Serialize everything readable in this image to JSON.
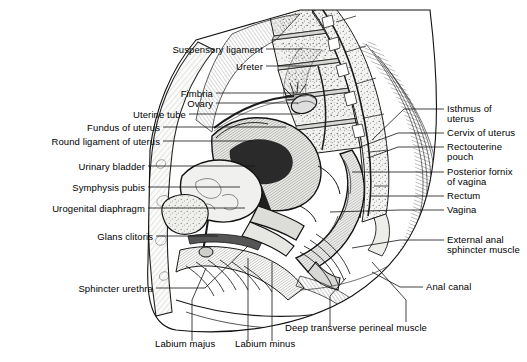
{
  "figure": {
    "background": "#ffffff",
    "ink": "#111111",
    "width": 527,
    "height": 362
  },
  "labels_left": [
    {
      "text": "Suspensory ligament",
      "x": 263,
      "y": 53
    },
    {
      "text": "Ureter",
      "x": 263,
      "y": 70
    },
    {
      "text": "Fimbria",
      "x": 213,
      "y": 97
    },
    {
      "text": "Ovary",
      "x": 213,
      "y": 107
    },
    {
      "text": "Uterine tube",
      "x": 186,
      "y": 118
    },
    {
      "text": "Fundus of uterus",
      "x": 160,
      "y": 131
    },
    {
      "text": "Round ligament of uterus",
      "x": 160,
      "y": 145
    },
    {
      "text": "Urinary bladder",
      "x": 145,
      "y": 170
    },
    {
      "text": "Symphysis pubis",
      "x": 145,
      "y": 191
    },
    {
      "text": "Urogenital diaphragm",
      "x": 145,
      "y": 212
    },
    {
      "text": "Glans clitoris",
      "x": 153,
      "y": 240
    },
    {
      "text": "Sphincter urethra",
      "x": 153,
      "y": 292
    }
  ],
  "labels_right": [
    {
      "text": "Isthmus of",
      "x": 447,
      "y": 112
    },
    {
      "text": "uterus",
      "x": 447,
      "y": 122
    },
    {
      "text": "Cervix of uterus",
      "x": 447,
      "y": 136
    },
    {
      "text": "Rectouterine",
      "x": 447,
      "y": 150
    },
    {
      "text": "pouch",
      "x": 447,
      "y": 160
    },
    {
      "text": "Posterior fornix",
      "x": 447,
      "y": 175
    },
    {
      "text": "of vagina",
      "x": 447,
      "y": 185
    },
    {
      "text": "Rectum",
      "x": 447,
      "y": 199
    },
    {
      "text": "Vagina",
      "x": 447,
      "y": 213
    },
    {
      "text": "External anal",
      "x": 447,
      "y": 243
    },
    {
      "text": "sphincter muscle",
      "x": 447,
      "y": 253
    },
    {
      "text": "Anal canal",
      "x": 426,
      "y": 290
    }
  ],
  "labels_bottom": [
    {
      "text": "Labium majus",
      "x": 155,
      "y": 347
    },
    {
      "text": "Labium minus",
      "x": 235,
      "y": 347
    },
    {
      "text": "Deep transverse perineal muscle",
      "x": 285,
      "y": 331
    }
  ],
  "leaders_left": [
    {
      "name": "suspensory-ligament",
      "d": "M266 49 L302 49"
    },
    {
      "name": "ureter",
      "d": "M266 66 L316 66"
    },
    {
      "name": "fimbria",
      "d": "M216 93 L300 93"
    },
    {
      "name": "ovary",
      "d": "M216 103 L298 103"
    },
    {
      "name": "uterine-tube",
      "d": "M189 114 L300 114"
    },
    {
      "name": "fundus-of-uterus",
      "d": "M163 127 L286 127"
    },
    {
      "name": "round-ligament",
      "d": "M163 141 L252 141"
    },
    {
      "name": "urinary-bladder",
      "d": "M148 166 L255 166"
    },
    {
      "name": "symphysis-pubis",
      "d": "M148 187 L240 187"
    },
    {
      "name": "urogenital-diaphragm",
      "d": "M148 208 L245 208"
    },
    {
      "name": "glans-clitoris",
      "d": "M156 236 L218 236"
    },
    {
      "name": "sphincter-urethra",
      "d": "M156 288 L205 288 L248 246"
    }
  ],
  "leaders_right": [
    {
      "name": "isthmus-of-uterus",
      "d": "M444 109 L404 109 L372 140"
    },
    {
      "name": "cervix-of-uterus",
      "d": "M444 133 L398 133 L360 147"
    },
    {
      "name": "rectouterine-pouch",
      "d": "M444 147 L398 147 L368 158"
    },
    {
      "name": "posterior-fornix",
      "d": "M444 172 L396 172 L352 172"
    },
    {
      "name": "rectum",
      "d": "M444 196 L398 196 L370 196"
    },
    {
      "name": "vagina",
      "d": "M444 210 L400 210 L330 212"
    },
    {
      "name": "external-anal-sphincter",
      "d": "M444 240 L400 240 L352 248"
    },
    {
      "name": "anal-canal",
      "d": "M423 287 L400 287 L372 272"
    }
  ],
  "leaders_bottom": [
    {
      "name": "labium-majus",
      "d": "M192 341 L192 300 L206 268"
    },
    {
      "name": "labium-minus",
      "d": "M248 341 L248 258"
    },
    {
      "name": "labium-minus-2",
      "d": "M272 341 L272 262"
    },
    {
      "name": "deep-transverse-perineal",
      "d": "M330 327 L330 296 L346 278"
    },
    {
      "name": "deep-transverse-perineal-2",
      "d": "M406 322 L406 300 L372 262"
    }
  ],
  "icons": {
    "vertebra": "vertebra-icon",
    "sacrum": "sacrum-icon",
    "uterus": "uterus-icon",
    "bladder": "bladder-icon",
    "rectum": "rectum-icon"
  }
}
